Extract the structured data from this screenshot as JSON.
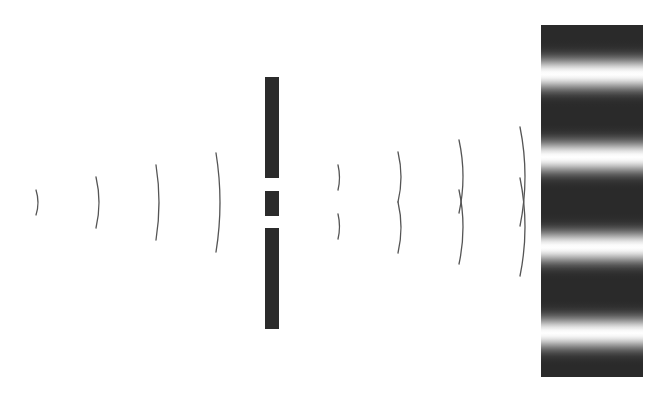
{
  "diagram": {
    "title": "Double-slit interference",
    "colors": {
      "background": "#ffffff",
      "wavefront": "#555555",
      "barrier": "#2b2b2b",
      "screen_dark": "#2a2a2a",
      "screen_bright": "#ffffff"
    },
    "incident_waves": [
      {
        "x": 36,
        "top": 190,
        "bottom": 215,
        "bulge": 2
      },
      {
        "x": 96,
        "top": 177,
        "bottom": 228,
        "bulge": 3
      },
      {
        "x": 156,
        "top": 165,
        "bottom": 240,
        "bulge": 3
      },
      {
        "x": 216,
        "top": 153,
        "bottom": 252,
        "bulge": 4
      }
    ],
    "barrier": {
      "x": 265,
      "width": 14,
      "segments": [
        {
          "name": "top",
          "y": 77,
          "height": 101
        },
        {
          "name": "middle",
          "y": 191,
          "height": 25
        },
        {
          "name": "bottom",
          "y": 228,
          "height": 101
        }
      ],
      "slits": [
        {
          "name": "upper-slit",
          "y": 178,
          "height": 13
        },
        {
          "name": "lower-slit",
          "y": 216,
          "height": 12
        }
      ]
    },
    "diffracted_waves": [
      {
        "upper": {
          "x": 338,
          "top": 165,
          "bottom": 190
        },
        "lower": {
          "x": 338,
          "top": 214,
          "bottom": 239
        },
        "bulge": 1.5
      },
      {
        "upper": {
          "x": 398,
          "top": 152,
          "bottom": 202
        },
        "lower": {
          "x": 398,
          "top": 202,
          "bottom": 253
        },
        "bulge": 3
      },
      {
        "upper": {
          "x": 459,
          "top": 140,
          "bottom": 213
        },
        "lower": {
          "x": 459,
          "top": 190,
          "bottom": 264
        },
        "bulge": 4
      },
      {
        "upper": {
          "x": 520,
          "top": 127,
          "bottom": 226
        },
        "lower": {
          "x": 520,
          "top": 178,
          "bottom": 276
        },
        "bulge": 5
      }
    ],
    "screen": {
      "x": 541,
      "y": 25,
      "width": 102,
      "height": 352,
      "bright_fringes_y": [
        74,
        157,
        247,
        333
      ],
      "fringe_half_width": 42
    }
  }
}
